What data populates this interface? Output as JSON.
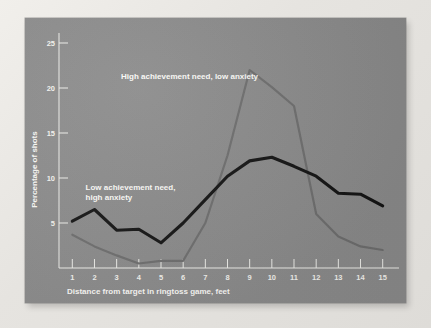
{
  "figure": {
    "panel_bg": "#8b8b8b",
    "page_bg": "#eceae6",
    "axis_color": "#eeeeea",
    "text_color": "#fbfaf7"
  },
  "chart_data": {
    "type": "line",
    "title": "",
    "xlabel": "Distance from target in ringtoss game, feet",
    "ylabel": "Percentage of shots",
    "xlim": [
      0.4,
      15.6
    ],
    "ylim": [
      0,
      25
    ],
    "xticks": [
      1,
      2,
      3,
      4,
      5,
      6,
      7,
      8,
      9,
      10,
      11,
      12,
      13,
      14,
      15
    ],
    "xticklabels": [
      "1",
      "2",
      "3",
      "4",
      "5",
      "6",
      "7",
      "8",
      "9",
      "10",
      "11",
      "12",
      "13",
      "14",
      "15"
    ],
    "yticks": [
      5,
      10,
      15,
      20,
      25
    ],
    "yticklabels": [
      "5",
      "10",
      "15",
      "20",
      "25"
    ],
    "grid": false,
    "legend_position": "inline-annotations",
    "x": [
      1,
      2,
      3,
      4,
      5,
      6,
      7,
      8,
      9,
      10,
      11,
      12,
      13,
      14,
      15
    ],
    "series": [
      {
        "name": "Low achievement need, high anxiety",
        "color": "#141414",
        "style": "thick-black",
        "values": [
          5.2,
          6.5,
          4.2,
          4.3,
          2.8,
          5.0,
          7.6,
          10.2,
          11.9,
          12.3,
          11.3,
          10.2,
          8.3,
          8.2,
          6.9
        ]
      },
      {
        "name": "High achievement need, low anxiety",
        "color": "#6e6e6e",
        "style": "thin-gray",
        "values": [
          3.7,
          2.4,
          1.4,
          0.5,
          0.8,
          0.8,
          5.0,
          12.5,
          22.0,
          20.1,
          18.0,
          6.0,
          3.5,
          2.4,
          2.0
        ]
      }
    ],
    "annotations": [
      {
        "text": "High achievement need, low anxiety",
        "lines": [
          "High achievement need, low anxiety"
        ],
        "x": 3.2,
        "y": 21.0
      },
      {
        "text": "Low achievement need, high anxiety",
        "lines": [
          "Low achievement need,",
          "high anxiety"
        ],
        "x": 1.6,
        "y": 8.7
      }
    ]
  }
}
